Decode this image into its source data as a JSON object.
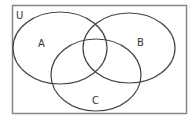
{
  "diagram": {
    "type": "venn",
    "universe_label": "U",
    "sets": [
      {
        "label": "A"
      },
      {
        "label": "B"
      },
      {
        "label": "C"
      }
    ],
    "colors": {
      "frame": "#888888",
      "circle": "#444444",
      "text": "#333333",
      "background": "#ffffff"
    }
  }
}
